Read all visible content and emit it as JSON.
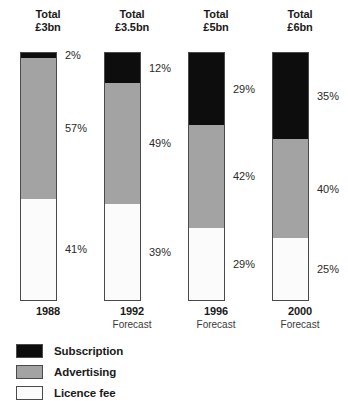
{
  "chart_data": {
    "type": "bar",
    "subtype": "stacked-bar-100-percent",
    "title": "",
    "xlabel": "",
    "ylabel": "",
    "ylim": [
      0,
      100
    ],
    "grid": false,
    "legend_position": "bottom-left",
    "categories": [
      "1988",
      "1992",
      "1996",
      "2000"
    ],
    "category_notes": [
      "",
      "Forecast",
      "Forecast",
      "Forecast"
    ],
    "totals": [
      "£3bn",
      "£3.5bn",
      "£5bn",
      "£6bn"
    ],
    "total_word": "Total",
    "series": [
      {
        "name": "Subscription",
        "color": "#0d0d0d",
        "values": [
          2,
          12,
          29,
          35
        ]
      },
      {
        "name": "Advertising",
        "color": "#a3a3a3",
        "values": [
          57,
          49,
          42,
          40
        ]
      },
      {
        "name": "Licence fee",
        "color": "#fbfbfb",
        "values": [
          41,
          39,
          29,
          25
        ]
      }
    ],
    "value_suffix": "%"
  },
  "bars": [
    {
      "total_word": "Total",
      "total_value": "£3bn",
      "year": "1988",
      "note": "",
      "segments": [
        {
          "name": "Subscription",
          "pct": 2,
          "label": "2%"
        },
        {
          "name": "Advertising",
          "pct": 57,
          "label": "57%"
        },
        {
          "name": "Licence fee",
          "pct": 41,
          "label": "41%"
        }
      ]
    },
    {
      "total_word": "Total",
      "total_value": "£3.5bn",
      "year": "1992",
      "note": "Forecast",
      "segments": [
        {
          "name": "Subscription",
          "pct": 12,
          "label": "12%"
        },
        {
          "name": "Advertising",
          "pct": 49,
          "label": "49%"
        },
        {
          "name": "Licence fee",
          "pct": 39,
          "label": "39%"
        }
      ]
    },
    {
      "total_word": "Total",
      "total_value": "£5bn",
      "year": "1996",
      "note": "Forecast",
      "segments": [
        {
          "name": "Subscription",
          "pct": 29,
          "label": "29%"
        },
        {
          "name": "Advertising",
          "pct": 42,
          "label": "42%"
        },
        {
          "name": "Licence fee",
          "pct": 29,
          "label": "29%"
        }
      ]
    },
    {
      "total_word": "Total",
      "total_value": "£6bn",
      "year": "2000",
      "note": "Forecast",
      "segments": [
        {
          "name": "Subscription",
          "pct": 35,
          "label": "35%"
        },
        {
          "name": "Advertising",
          "pct": 40,
          "label": "40%"
        },
        {
          "name": "Licence fee",
          "pct": 25,
          "label": "25%"
        }
      ]
    }
  ],
  "legend": {
    "items": [
      {
        "label": "Subscription",
        "swatch": "sw-subscription",
        "color": "#0d0d0d"
      },
      {
        "label": "Advertising",
        "swatch": "sw-advertising",
        "color": "#a3a3a3"
      },
      {
        "label": "Licence fee",
        "swatch": "sw-licence",
        "color": "#fbfbfb"
      }
    ]
  },
  "layout": {
    "bar_x_positions": [
      20,
      104,
      188,
      272
    ],
    "bar_top": 52,
    "bar_height": 249,
    "bar_width": 37
  }
}
